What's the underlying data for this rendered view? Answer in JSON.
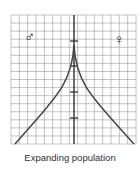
{
  "diagram": {
    "type": "population-pyramid",
    "caption": "Expanding population",
    "left_symbol": "♂",
    "left_label": "male",
    "right_symbol": "♀",
    "right_label": "female",
    "grid": {
      "x0": 11,
      "y0": 15,
      "x1": 136,
      "y1": 144,
      "cols": 15,
      "rows": 16
    },
    "axis_x": 74,
    "axis_ticks_y": [
      41,
      66,
      92,
      118
    ],
    "curve": {
      "apex_y": 45,
      "base_left_x": 15,
      "base_right_x": 134,
      "base_y": 144
    },
    "colors": {
      "grid": "#9a9a9a",
      "line": "#444444",
      "axis": "#222222",
      "text": "#333333"
    }
  }
}
